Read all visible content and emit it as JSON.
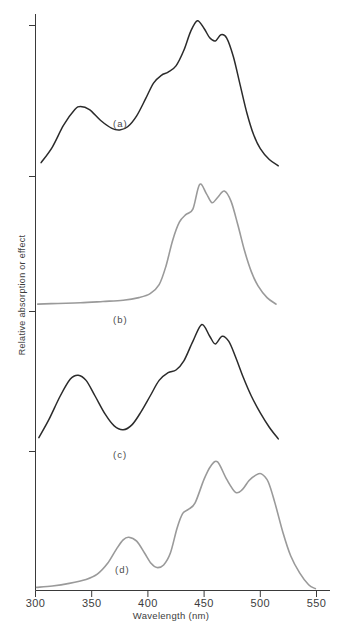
{
  "chart_data": {
    "type": "line",
    "title": "",
    "xlabel": "Wavelength (nm)",
    "ylabel": "Relative absorption or effect",
    "xlim": [
      300,
      550
    ],
    "ylim": [
      0,
      1
    ],
    "grid": false,
    "legend_position": "none",
    "xticks": [
      300,
      350,
      400,
      450,
      500,
      550
    ],
    "xtick_labels": [
      "300",
      "350",
      "400",
      "450",
      "500",
      "550"
    ],
    "yticks": [],
    "panels": [
      {
        "label": "(a)",
        "color": "#2b2b2b",
        "description": "Broad band near 340 nm, shoulder near 415 nm, main peak 444 nm with secondary peak 465 nm",
        "x": [
          305,
          315,
          325,
          335,
          340,
          348,
          358,
          368,
          375,
          382,
          390,
          398,
          405,
          412,
          418,
          425,
          432,
          438,
          444,
          450,
          455,
          460,
          465,
          470,
          476,
          482,
          488,
          494,
          500,
          508,
          516
        ],
        "y": [
          0.06,
          0.16,
          0.3,
          0.4,
          0.42,
          0.4,
          0.33,
          0.28,
          0.27,
          0.29,
          0.36,
          0.47,
          0.57,
          0.62,
          0.64,
          0.68,
          0.78,
          0.9,
          0.97,
          0.92,
          0.86,
          0.84,
          0.88,
          0.86,
          0.74,
          0.56,
          0.38,
          0.24,
          0.15,
          0.08,
          0.04
        ]
      },
      {
        "label": "(b)",
        "color": "#9a9a9a",
        "description": "Flat baseline to 400 nm, steep rise, peaks at 447 nm and 468 nm",
        "x": [
          302,
          320,
          340,
          360,
          378,
          392,
          402,
          410,
          416,
          422,
          428,
          434,
          440,
          446,
          452,
          457,
          462,
          468,
          474,
          480,
          486,
          492,
          498,
          506,
          514
        ],
        "y": [
          0.03,
          0.035,
          0.04,
          0.05,
          0.06,
          0.08,
          0.11,
          0.18,
          0.32,
          0.52,
          0.66,
          0.72,
          0.76,
          0.95,
          0.88,
          0.81,
          0.85,
          0.9,
          0.82,
          0.64,
          0.44,
          0.28,
          0.17,
          0.08,
          0.03
        ]
      },
      {
        "label": "(c)",
        "color": "#2b2b2b",
        "description": "Peak at 340 nm, trough near 378 nm, shoulder 420 nm, main peaks 448 nm and 468 nm",
        "x": [
          303,
          312,
          322,
          331,
          338,
          345,
          353,
          362,
          370,
          378,
          386,
          394,
          402,
          410,
          418,
          425,
          432,
          440,
          448,
          455,
          460,
          466,
          472,
          478,
          485,
          492,
          500,
          508,
          516
        ],
        "y": [
          0.08,
          0.22,
          0.4,
          0.53,
          0.56,
          0.52,
          0.4,
          0.26,
          0.17,
          0.14,
          0.18,
          0.28,
          0.4,
          0.52,
          0.58,
          0.6,
          0.67,
          0.82,
          0.95,
          0.86,
          0.8,
          0.86,
          0.82,
          0.7,
          0.54,
          0.4,
          0.27,
          0.16,
          0.07
        ]
      },
      {
        "label": "(d)",
        "color": "#9a9a9a",
        "description": "Low rising tail, distinct peak at 383 nm, trough 408 nm, shoulder 433 nm, peaks at 462 nm and 500 nm",
        "x": [
          301,
          315,
          330,
          345,
          355,
          364,
          372,
          378,
          383,
          390,
          397,
          403,
          408,
          414,
          420,
          426,
          431,
          436,
          442,
          450,
          456,
          462,
          470,
          478,
          484,
          490,
          496,
          501,
          507,
          513,
          520,
          527,
          535,
          543,
          549
        ],
        "y": [
          0.02,
          0.03,
          0.05,
          0.08,
          0.12,
          0.2,
          0.31,
          0.38,
          0.4,
          0.37,
          0.28,
          0.2,
          0.17,
          0.19,
          0.28,
          0.47,
          0.58,
          0.61,
          0.66,
          0.84,
          0.94,
          0.97,
          0.84,
          0.74,
          0.76,
          0.83,
          0.87,
          0.88,
          0.82,
          0.66,
          0.44,
          0.26,
          0.13,
          0.04,
          0.01
        ]
      }
    ]
  }
}
